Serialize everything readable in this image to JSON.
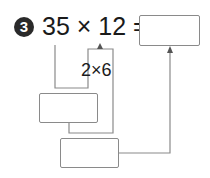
{
  "problem": {
    "number": "3",
    "expression": "35 × 12 =",
    "decomposition": "2×6"
  },
  "answer_boxes": {
    "final": "",
    "step1": "",
    "step2": ""
  },
  "colors": {
    "text": "#1a1a1a",
    "badge": "#2a2a2a",
    "lines": "#8a8a8a"
  }
}
